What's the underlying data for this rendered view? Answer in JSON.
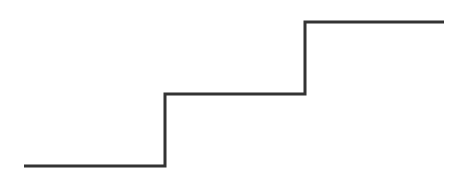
{
  "diagram": {
    "type": "step-line",
    "stroke_color": "#333333",
    "stroke_width": 3,
    "background": "#ffffff",
    "points": [
      [
        24,
        166
      ],
      [
        165,
        166
      ],
      [
        165,
        94
      ],
      [
        305,
        94
      ],
      [
        305,
        22
      ],
      [
        444,
        22
      ]
    ],
    "steps": [
      {
        "level": "low",
        "x_start": 24,
        "x_end": 165,
        "y": 166
      },
      {
        "level": "middle",
        "x_start": 165,
        "x_end": 305,
        "y": 94
      },
      {
        "level": "high",
        "x_start": 305,
        "x_end": 444,
        "y": 22
      }
    ]
  }
}
